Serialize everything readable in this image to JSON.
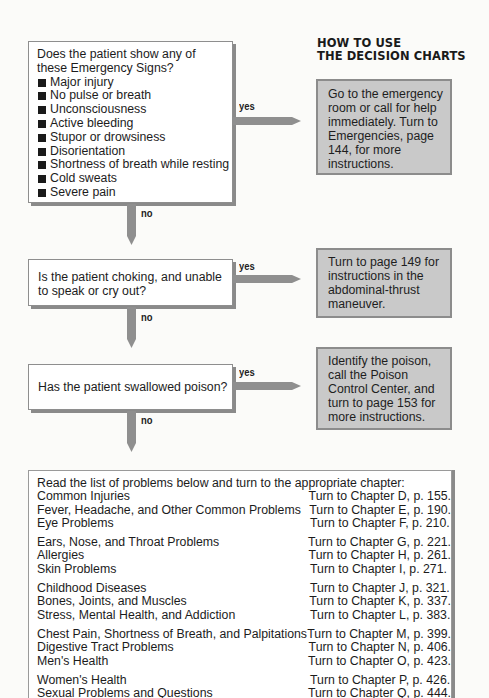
{
  "heading": {
    "line1": "HOW TO USE",
    "line2": "THE DECISION CHARTS"
  },
  "flow": {
    "yes_label": "yes",
    "no_label": "no",
    "questions": [
      {
        "prompt": "Does the patient show any of these Emergency Signs?",
        "signs": [
          "Major injury",
          "No pulse or breath",
          "Unconsciousness",
          "Active bleeding",
          "Stupor or drowsiness",
          "Disorientation",
          "Shortness of breath while resting",
          "Cold sweats",
          "Severe pain"
        ],
        "yes_action": "Go to the emergency room or call for help immediately. Turn to Emergencies, page 144, for more instructions."
      },
      {
        "prompt": "Is the patient choking, and unable to speak or cry out?",
        "yes_action": "Turn to page 149 for instructions in the abdominal-thrust maneuver."
      },
      {
        "prompt": "Has the patient swallowed poison?",
        "yes_action": "Identify the poison, call the Poison Control Center, and turn to page 153 for more instructions."
      }
    ]
  },
  "chapters": {
    "intro": "Read the list of problems below and turn to the appropriate chapter:",
    "groups": [
      [
        {
          "topic": "Common Injuries",
          "ref": "Turn to Chapter D, p. 155."
        },
        {
          "topic": "Fever, Headache, and Other Common Problems",
          "ref": "Turn to Chapter E, p. 190."
        },
        {
          "topic": "Eye Problems",
          "ref": "Turn to Chapter F, p. 210."
        }
      ],
      [
        {
          "topic": "Ears, Nose, and Throat Problems",
          "ref": "Turn to Chapter G, p. 221."
        },
        {
          "topic": "Allergies",
          "ref": "Turn to Chapter H, p. 261."
        },
        {
          "topic": "Skin Problems",
          "ref": "Turn to Chapter I, p. 271."
        }
      ],
      [
        {
          "topic": "Childhood Diseases",
          "ref": "Turn to Chapter J, p. 321."
        },
        {
          "topic": "Bones, Joints, and Muscles",
          "ref": "Turn to Chapter K, p. 337."
        },
        {
          "topic": "Stress, Mental Health, and Addiction",
          "ref": "Turn to Chapter L, p. 383."
        }
      ],
      [
        {
          "topic": "Chest Pain, Shortness of Breath, and Palpitations",
          "ref": "Turn to Chapter M, p. 399."
        },
        {
          "topic": "Digestive Tract Problems",
          "ref": "Turn to Chapter N, p. 406."
        },
        {
          "topic": "Men's Health",
          "ref": "Turn to Chapter O, p. 423."
        }
      ],
      [
        {
          "topic": "Women's Health",
          "ref": "Turn to Chapter P, p. 426."
        },
        {
          "topic": "Sexual Problems and Questions",
          "ref": "Turn to Chapter Q, p. 444."
        }
      ]
    ]
  },
  "colors": {
    "answer_box_fill": "#c9c9c9",
    "arrow_fill": "#8f8f8f",
    "box_border": "#8e8e8e"
  }
}
